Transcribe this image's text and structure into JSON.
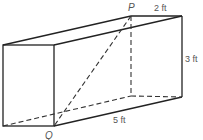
{
  "diagram": {
    "type": "rectangular-prism",
    "labels": {
      "point_p": "P",
      "point_q": "Q",
      "width": "2 ft",
      "height": "3 ft",
      "length": "5 ft"
    },
    "dimensions_ft": {
      "width": 2,
      "height": 3,
      "length": 5
    },
    "diagonal": {
      "from": "P",
      "to": "Q",
      "style": "dashed"
    }
  }
}
